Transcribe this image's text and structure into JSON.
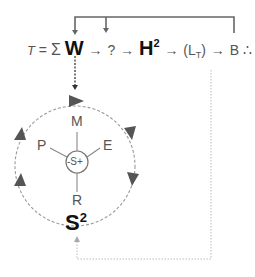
{
  "equation": {
    "t_label": "T",
    "equals": "=",
    "sigma": "Σ",
    "w": "W",
    "arrow": "→",
    "q1": "?",
    "h": "H",
    "h_sup": "2",
    "l_open": "(L",
    "l_sub": "T",
    "l_close": ")",
    "b": "B",
    "therefore": "∴",
    "q2": "?"
  },
  "cycle": {
    "top": "M",
    "left": "P",
    "right": "E",
    "bottom": "R",
    "center": "-S+",
    "base": "S",
    "base_sup": "2"
  },
  "colors": {
    "text": "#555555",
    "bold_text": "#111111",
    "lines": "#666666",
    "dotted": "#bbbbbb",
    "arrowheads": "#555555"
  }
}
